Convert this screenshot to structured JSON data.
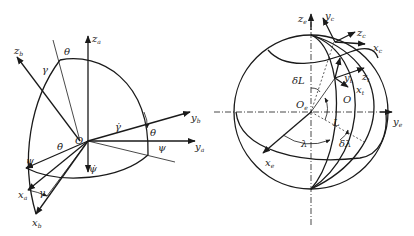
{
  "left_diagram": {
    "name": "euler-angle-frames",
    "origin": "O",
    "axes": [
      {
        "id": "z_a",
        "base": "z",
        "sub": "a"
      },
      {
        "id": "z_b",
        "base": "z",
        "sub": "b"
      },
      {
        "id": "y_b",
        "base": "y",
        "sub": "b"
      },
      {
        "id": "y_a",
        "base": "y",
        "sub": "a"
      },
      {
        "id": "x_a",
        "base": "x",
        "sub": "a"
      },
      {
        "id": "x_b",
        "base": "x",
        "sub": "b"
      }
    ],
    "angles": {
      "theta_top": "θ",
      "gamma_top": "γ",
      "gamma_dot": "γ̇",
      "theta_right": "θ",
      "psi_right": "ψ",
      "theta_dot": "θ̇",
      "psi_left": "ψ",
      "psi_dot": "ψ̇",
      "gamma_bottom": "γ"
    }
  },
  "right_diagram": {
    "name": "earth-sphere-frames",
    "origin_earth": {
      "base": "O",
      "sub": "e"
    },
    "origin_local": "O",
    "axes": [
      {
        "id": "z_e",
        "base": "z",
        "sub": "e"
      },
      {
        "id": "y_c",
        "base": "y",
        "sub": "c"
      },
      {
        "id": "z_c",
        "base": "z",
        "sub": "c"
      },
      {
        "id": "x_c",
        "base": "x",
        "sub": "c"
      },
      {
        "id": "y_t",
        "base": "y",
        "sub": "t"
      },
      {
        "id": "z_t",
        "base": "z",
        "sub": "t"
      },
      {
        "id": "x_t",
        "base": "x",
        "sub": "t"
      },
      {
        "id": "y_e",
        "base": "y",
        "sub": "e"
      },
      {
        "id": "x_e",
        "base": "x",
        "sub": "e"
      }
    ],
    "angles": {
      "delta_L": "δL",
      "L": "L",
      "lambda": "λ",
      "delta_lambda": "δλ"
    }
  }
}
